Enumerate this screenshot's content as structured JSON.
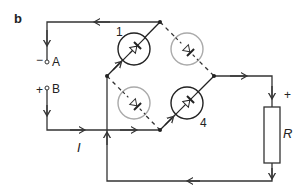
{
  "figure": {
    "panel_label": "b",
    "terminals": {
      "a": {
        "label": "A",
        "polarity": "−"
      },
      "b": {
        "label": "B",
        "polarity": "+"
      }
    },
    "diodes": [
      {
        "label": "1",
        "position": "top-left",
        "state": "conducting"
      },
      {
        "label": "",
        "position": "top-right",
        "state": "off"
      },
      {
        "label": "",
        "position": "bottom-left",
        "state": "off"
      },
      {
        "label": "4",
        "position": "bottom-right",
        "state": "conducting"
      }
    ],
    "resistor": {
      "label": "R",
      "polarity": "+"
    },
    "current_label": "I",
    "colors": {
      "active": "#222222",
      "inactive": "#aaaaaa",
      "wire": "#333333"
    }
  }
}
